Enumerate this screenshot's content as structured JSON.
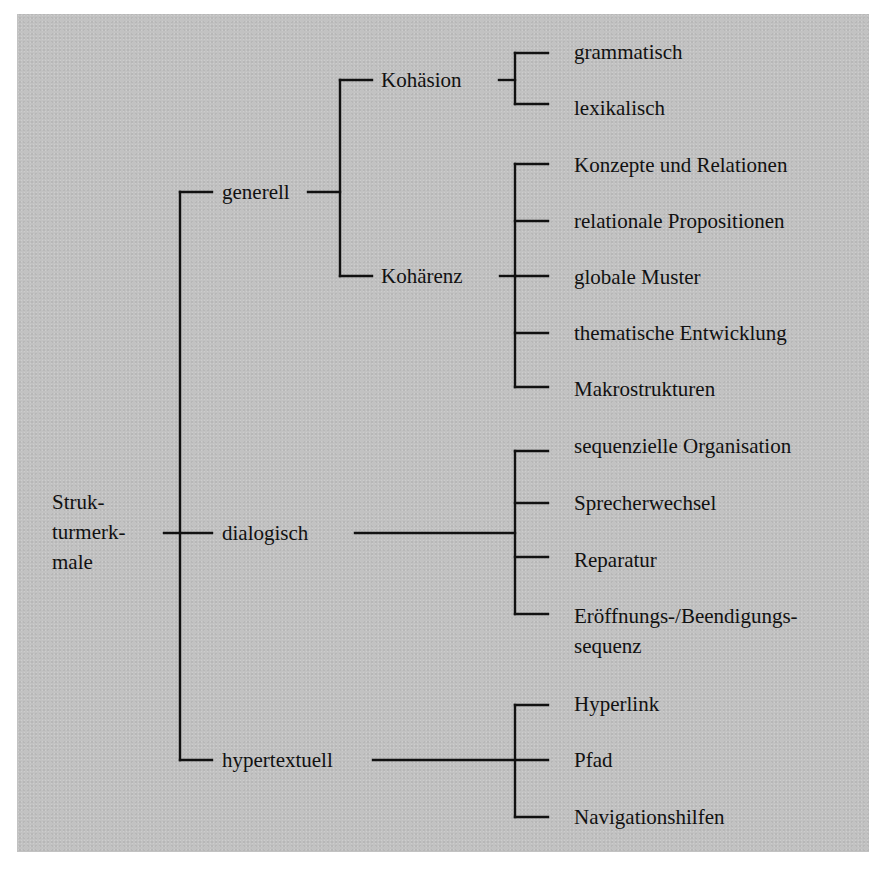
{
  "diagram": {
    "type": "tree",
    "root": {
      "label": "Struk-\nturmerk-\nmale",
      "label_flat": "Strukturmerkmale"
    },
    "level1": [
      {
        "label": "generell",
        "children": [
          {
            "label": "Kohäsion",
            "children": [
              "grammatisch",
              "lexikalisch"
            ]
          },
          {
            "label": "Kohärenz",
            "children": [
              "Konzepte und Relationen",
              "relationale Propositionen",
              "globale Muster",
              "thematische Entwicklung",
              "Makrostrukturen"
            ]
          }
        ]
      },
      {
        "label": "dialogisch",
        "children": [
          "sequenzielle Organisation",
          "Sprecherwechsel",
          "Reparatur",
          "Eröffnungs-/Beendigungs-\nsequenz"
        ]
      },
      {
        "label": "hypertextuell",
        "children": [
          "Hyperlink",
          "Pfad",
          "Navigationshilfen"
        ]
      }
    ],
    "colors": {
      "background": "#c2c2c2",
      "ink": "#111111",
      "page": "#ffffff"
    }
  }
}
